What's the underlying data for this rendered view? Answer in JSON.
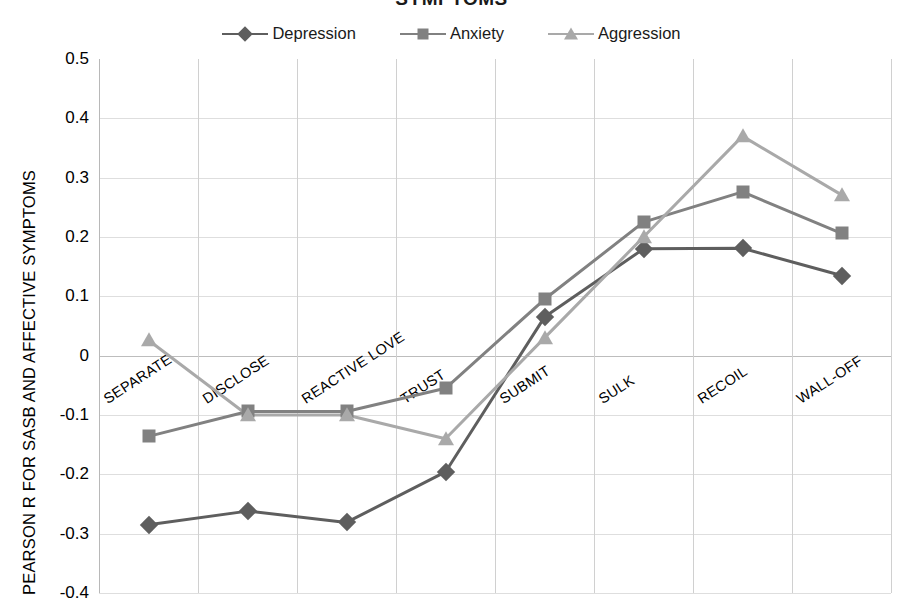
{
  "chart_data": {
    "type": "line",
    "title": "SYMPTOMS",
    "xlabel": "",
    "ylabel": "PEARSON R FOR SASB AND AFFECTIVE SYMPTOMS",
    "categories": [
      "SEPARATE",
      "DISCLOSE",
      "REACTIVE LOVE",
      "TRUST",
      "SUBMIT",
      "SULK",
      "RECOIL",
      "WALL-OFF"
    ],
    "ylim": [
      -0.4,
      0.5
    ],
    "ytick_labels": [
      "0.5",
      "0.4",
      "0.3",
      "0.2",
      "0.1",
      "0",
      "-0.1",
      "-0.2",
      "-0.3",
      "-0.4"
    ],
    "ytick_values": [
      0.5,
      0.4,
      0.3,
      0.2,
      0.1,
      0,
      -0.1,
      -0.2,
      -0.3,
      -0.4
    ],
    "grid": true,
    "legend_position": "top",
    "series": [
      {
        "name": "Depression",
        "marker": "diamond-marker",
        "color": "#5e5e5e",
        "values": [
          -0.285,
          -0.262,
          -0.281,
          -0.196,
          0.065,
          0.18,
          0.181,
          0.135
        ]
      },
      {
        "name": "Anxiety",
        "marker": "square-marker",
        "color": "#818181",
        "values": [
          -0.136,
          -0.094,
          -0.094,
          -0.055,
          0.095,
          0.225,
          0.276,
          0.206
        ]
      },
      {
        "name": "Aggression",
        "marker": "triangle-marker",
        "color": "#a9a9a9",
        "values": [
          0.026,
          -0.1,
          -0.1,
          -0.14,
          0.03,
          0.2,
          0.37,
          0.271
        ]
      }
    ]
  }
}
